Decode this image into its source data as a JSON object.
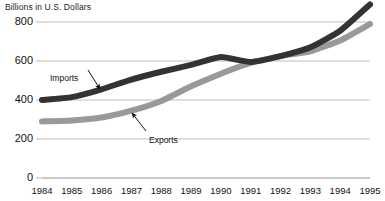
{
  "chart_data": {
    "type": "line",
    "title": "Billions in U.S. Dollars",
    "xlabel": "",
    "ylabel": "",
    "ylim": [
      0,
      900
    ],
    "xlim": [
      1984,
      1995
    ],
    "grid": true,
    "legend_position": "inline-annotations",
    "yticks": [
      0,
      200,
      400,
      600,
      800
    ],
    "ytick_labels": [
      "0",
      "200",
      "400",
      "600",
      "800"
    ],
    "categories": [
      1984,
      1985,
      1986,
      1987,
      1988,
      1989,
      1990,
      1991,
      1992,
      1993,
      1994,
      1995
    ],
    "xtick_labels": [
      "1984",
      "1985",
      "1986",
      "1987",
      "1988",
      "1989",
      "1990",
      "1991",
      "1992",
      "1993",
      "1994",
      "1995"
    ],
    "series": [
      {
        "name": "Imports",
        "color": "#333333",
        "values": [
          400,
          415,
          455,
          505,
          545,
          580,
          620,
          595,
          625,
          670,
          755,
          890
        ]
      },
      {
        "name": "Exports",
        "color": "#999999",
        "values": [
          290,
          295,
          310,
          345,
          395,
          470,
          535,
          590,
          625,
          650,
          705,
          790
        ]
      }
    ],
    "annotations": [
      {
        "text": "Imports",
        "label_x": 50,
        "label_y": 74,
        "arrow_from_x": 88,
        "arrow_from_y": 70,
        "arrow_to_x": 100,
        "arrow_to_y": 89
      },
      {
        "text": "Exports",
        "label_x": 149,
        "label_y": 136,
        "arrow_from_x": 146,
        "arrow_from_y": 131,
        "arrow_to_x": 132,
        "arrow_to_y": 113
      }
    ]
  },
  "colors": {
    "imports": "#333333",
    "exports": "#999999",
    "gridline": "#b8b8b8",
    "text": "#111111",
    "background": "#ffffff"
  }
}
